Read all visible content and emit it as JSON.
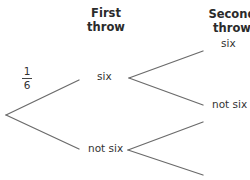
{
  "headers": {
    "first": [
      "First",
      "throw"
    ],
    "second": [
      "Second",
      "throw"
    ]
  },
  "probability": {
    "numerator": "1",
    "denominator": "6"
  },
  "labels": {
    "first_six": "six",
    "first_not_six": "not six",
    "second_six": "six",
    "second_not_six": "not six"
  },
  "colors": {
    "line": "#6b6b6b",
    "text": "#333333"
  }
}
